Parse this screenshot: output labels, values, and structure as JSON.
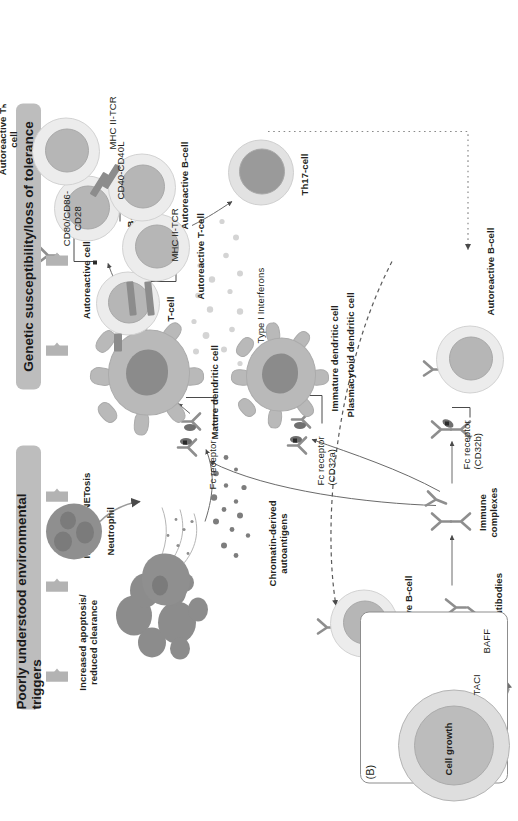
{
  "figure": {
    "panel_label": "(B)",
    "domain": "Diagram",
    "type": "biological-pathway-schematic"
  },
  "banners": [
    {
      "id": "environmental",
      "label": "Poorly understood environmental triggers",
      "color": "#bdbdbd"
    },
    {
      "id": "genetic",
      "label": "Genetic susceptibility/loss of tolerance",
      "color": "#bdbdbd"
    }
  ],
  "section_labels": {
    "autoreactive_cells": "Autoreactive cells",
    "increased_apoptosis": "Increased apoptosis/\nreduced clearance",
    "increased_netosis": "Increased NETosis",
    "chromatin_antigens": "Chromatin-derived\nautoantigens"
  },
  "cells": {
    "t_cell": "T-cell",
    "b_cell": "B-cell",
    "neutrophil": "Neutrophil",
    "mature_dc": "Mature dendritic cell",
    "immature_dc": "Immature dendritic cell",
    "plasmacytoid_dc": "Plasmacytoid dendritic cell",
    "autoreactive_t_cell": "Autoreactive T-cell",
    "autoreactive_th_cell": "Autoreactive Tₕ\ncell",
    "autoreactive_b_cell_top": "Autoreactive B-cell",
    "autoreactive_b_cell_mid": "Autoreactive B-cell",
    "autoreactive_b_cell_bottom": "Autoreactive B-cell",
    "th17_cell": "Th17-cell"
  },
  "interactions": {
    "mhc_tcr_dc": "MHC II-TCR",
    "mhc_tcr_b": "MHC II-TCR",
    "cd80_cd86_cd28": "CD80/CD86-\nCD28",
    "cd40_cd40l": "CD40-CD40L",
    "fc_receptor": "Fc receptor",
    "fc_receptor_cd32a": "Fc receptor\n(CD32a)",
    "fc_receptor_cd32b": "Fc receptor\n(CD32b)"
  },
  "molecules": {
    "autoantibodies": "Autoantibodies",
    "immune_complexes": "Immune\ncomplexes",
    "type_i_interferons": "Type I Interferons"
  },
  "inset": {
    "title": "(B)",
    "cell_growth": "Cell growth",
    "taci": "TACI",
    "baff": "BAFF"
  },
  "colors": {
    "banner": "#bdbdbd",
    "cytoplasm": "#ececec",
    "nucleus": "#b6b6b6",
    "dendritic": "#b9b9b9",
    "neutrophil": "#8f8f8f",
    "line": "#5a5a5a",
    "text": "#231f20"
  }
}
